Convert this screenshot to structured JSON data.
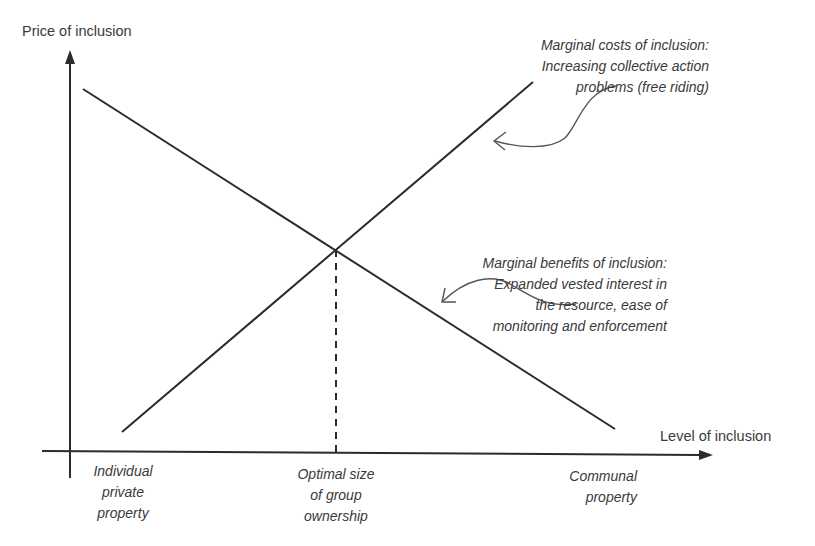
{
  "diagram": {
    "y_axis_label": "Price of inclusion",
    "x_axis_label": "Level of inclusion",
    "curves": {
      "marginal_costs": {
        "label_lines": [
          "Marginal costs of inclusion:",
          "Increasing collective action",
          "problems (free riding)"
        ],
        "direction": "rising"
      },
      "marginal_benefits": {
        "label_lines": [
          "Marginal benefits of inclusion:",
          "Expanded vested interest in",
          "the resource, ease of",
          "monitoring and enforcement"
        ],
        "direction": "falling"
      }
    },
    "x_markers": {
      "left": {
        "label_lines": [
          "Individual",
          "private",
          "property"
        ]
      },
      "middle": {
        "label_lines": [
          "Optimal size",
          "of group",
          "ownership"
        ]
      },
      "right": {
        "label_lines": [
          "Communal",
          "property"
        ]
      }
    },
    "colors": {
      "line": "#2b2b2b",
      "arrow_curve": "#555555",
      "text": "#3a3a3a",
      "background": "#ffffff"
    }
  }
}
